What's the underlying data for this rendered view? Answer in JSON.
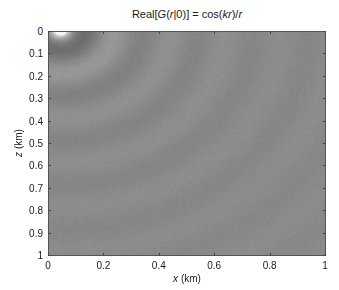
{
  "chart_data": {
    "type": "heatmap",
    "title": "Real[G(r|0)] = cos(kr)/r",
    "title_parts": {
      "pre": "Real[",
      "fn": "G",
      "arg": "(r|0)] = cos(kr)/r"
    },
    "xlabel": "x (km)",
    "ylabel": "z (km)",
    "xlim": [
      0,
      1
    ],
    "ylim": [
      0,
      1
    ],
    "y_inverted": true,
    "xticks": [
      "0",
      "0.2",
      "0.4",
      "0.6",
      "0.8",
      "1"
    ],
    "yticks": [
      "0",
      "0.1",
      "0.2",
      "0.3",
      "0.4",
      "0.5",
      "0.6",
      "0.7",
      "0.8",
      "0.9",
      "1"
    ],
    "colormap": "gray",
    "grid": false,
    "field": {
      "expression": "cos(k*r)/r",
      "source_x_km": 0.04,
      "source_z_km": -0.01,
      "wavelength_km": 0.2,
      "description": "Concentric circular rings centered near the top-left corner; bright white near source, dark ring around z≈0.1, alternating light/dark rings with spacing ≈0.2 km, amplitude decaying with distance"
    }
  },
  "colors": {
    "background": "#ffffff",
    "axis": "#555555",
    "text": "#1a1a1a",
    "mid_gray": "#8a8a8a"
  }
}
